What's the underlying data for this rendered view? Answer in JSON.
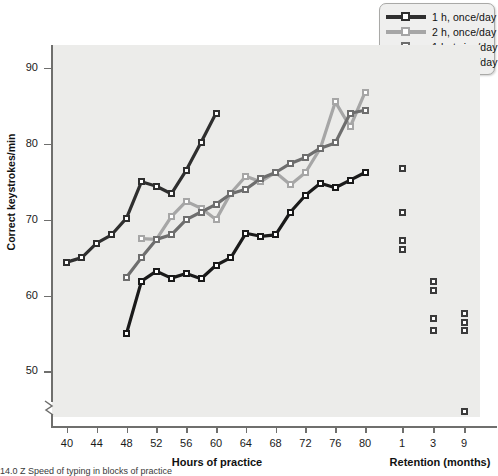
{
  "figure": {
    "caption": "14.0 Z    Speed of typing in blocks of practice"
  },
  "legend": {
    "position": "top-right",
    "items": [
      {
        "label": "1 h, once/day",
        "color": "#2f2f2f"
      },
      {
        "label": "2 h, once/day",
        "color": "#a6a6a6"
      },
      {
        "label": "1 h, twice/day",
        "color": "#6e6e6e"
      },
      {
        "label": "2 h, twice/day",
        "color": "#1a1a1a"
      }
    ]
  },
  "chart_data": {
    "type": "line",
    "title": "",
    "xlabel": "Hours of practice",
    "ylabel": "Correct keystrokes/min",
    "xlim": [
      38,
      82
    ],
    "ylim": [
      44,
      93
    ],
    "xticks": [
      40,
      44,
      48,
      52,
      56,
      60,
      64,
      68,
      72,
      76,
      80
    ],
    "yticks": [
      50,
      60,
      70,
      80,
      90
    ],
    "grid": false,
    "axis_break_y": true,
    "series": [
      {
        "name": "1 h, once/day",
        "color": "#2f2f2f",
        "x": [
          40,
          42,
          44,
          46,
          48,
          50,
          52,
          54,
          56,
          58
        ],
        "y": [
          64.4,
          65.0,
          66.9,
          68.0,
          70.2,
          75.0,
          74.4,
          73.4,
          76.5,
          80.2
        ]
      },
      {
        "name": "1 h, once/day (cont.)",
        "color": "#2f2f2f",
        "x": [
          58,
          60
        ],
        "y": [
          80.2,
          84.0
        ]
      },
      {
        "name": "2 h, once/day",
        "color": "#a6a6a6",
        "x": [
          50,
          52,
          54,
          56,
          58,
          60,
          62,
          64,
          66,
          68,
          70,
          72,
          74,
          76,
          78,
          80
        ],
        "y": [
          67.5,
          67.4,
          70.4,
          72.4,
          71.5,
          70.0,
          73.5,
          75.7,
          75.0,
          76.2,
          74.6,
          76.2,
          79.4,
          85.5,
          82.2,
          86.8
        ]
      },
      {
        "name": "1 h, twice/day",
        "color": "#6e6e6e",
        "x": [
          48,
          50,
          52,
          54,
          56,
          58,
          60,
          62,
          64,
          66,
          68,
          70,
          72,
          74,
          76,
          78,
          80
        ],
        "y": [
          62.4,
          65.0,
          67.4,
          68.0,
          70.0,
          71.0,
          72.0,
          73.4,
          74.0,
          75.4,
          76.2,
          77.4,
          78.2,
          79.4,
          80.1,
          84.0,
          84.4
        ]
      },
      {
        "name": "2 h, twice/day",
        "color": "#1a1a1a",
        "x": [
          48,
          50,
          52,
          54,
          56,
          58,
          60,
          62,
          64,
          66,
          68,
          70,
          72,
          74,
          76,
          78,
          80
        ],
        "y": [
          55.0,
          61.9,
          63.2,
          62.3,
          62.9,
          62.2,
          64.0,
          65.0,
          68.2,
          67.8,
          68.0,
          71.0,
          73.2,
          74.8,
          74.2,
          75.2,
          76.2
        ]
      }
    ],
    "retention_panel": {
      "xlabel": "Retention (months)",
      "xticks": [
        1,
        3,
        9
      ],
      "points": [
        {
          "month": 1,
          "value": 76.7
        },
        {
          "month": 1,
          "value": 71.0
        },
        {
          "month": 1,
          "value": 67.2
        },
        {
          "month": 1,
          "value": 66.0
        },
        {
          "month": 3,
          "value": 61.8
        },
        {
          "month": 3,
          "value": 60.7
        },
        {
          "month": 3,
          "value": 57.0
        },
        {
          "month": 3,
          "value": 55.4
        },
        {
          "month": 9,
          "value": 57.6
        },
        {
          "month": 9,
          "value": 56.5
        },
        {
          "month": 9,
          "value": 55.4
        },
        {
          "month": 9,
          "value": 44.7
        }
      ]
    }
  }
}
